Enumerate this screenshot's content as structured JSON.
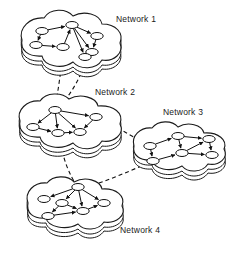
{
  "figure": {
    "background_color": "#ffffff",
    "line_color": "#111111",
    "node_fill": "#ffffff"
  },
  "labels": {
    "network1": "Network 1",
    "network2": "Network 2",
    "network3": "Network 3",
    "network4": "Network 4"
  },
  "chart_data": {
    "type": "diagram",
    "networks": [
      {
        "id": "network1",
        "label": "Network 1",
        "label_x": 116,
        "label_y": 22,
        "blob": {
          "cx": 68,
          "cy": 42,
          "path": "M 22 40 C 18 28 30 17 44 18 C 50 8 66 8 73 16 C 84 10 100 14 102 24 C 116 24 124 33 120 43 C 124 53 114 62 102 60 C 96 70 80 70 73 62 C 62 70 44 66 42 56 C 28 57 20 50 22 40 Z",
          "side_offsets": [
            5,
            9
          ]
        },
        "nodes": [
          {
            "id": "n1a",
            "x": 42,
            "y": 31
          },
          {
            "id": "n1b",
            "x": 72,
            "y": 25
          },
          {
            "id": "n1c",
            "x": 36,
            "y": 45
          },
          {
            "id": "n1d",
            "x": 63,
            "y": 47
          },
          {
            "id": "n1e",
            "x": 97,
            "y": 36
          },
          {
            "id": "n1f",
            "x": 92,
            "y": 52
          },
          {
            "id": "n1g",
            "x": 85,
            "y": 57
          }
        ],
        "edges": [
          {
            "from": "n1a",
            "to": "n1b",
            "directed": true
          },
          {
            "from": "n1a",
            "to": "n1c",
            "directed": true
          },
          {
            "from": "n1c",
            "to": "n1d",
            "directed": true
          },
          {
            "from": "n1d",
            "to": "n1b",
            "directed": true
          },
          {
            "from": "n1b",
            "to": "n1e",
            "directed": true
          },
          {
            "from": "n1b",
            "to": "n1f",
            "directed": true
          },
          {
            "from": "n1b",
            "to": "n1g",
            "directed": true
          },
          {
            "from": "n1e",
            "to": "n1f",
            "directed": true
          },
          {
            "from": "n1f",
            "to": "n1g",
            "directed": true
          }
        ]
      },
      {
        "id": "network2",
        "label": "Network 2",
        "label_x": 95,
        "label_y": 95,
        "blob": {
          "cx": 70,
          "cy": 123,
          "path": "M 20 121 C 16 110 27 100 40 101 C 46 92 62 92 69 99 C 80 93 96 97 98 106 C 114 105 124 113 120 124 C 125 134 114 143 102 141 C 96 151 80 151 73 143 C 60 151 42 147 40 137 C 26 138 18 131 20 121 Z",
          "side_offsets": [
            5,
            9
          ]
        },
        "nodes": [
          {
            "id": "n2a",
            "x": 55,
            "y": 110
          },
          {
            "id": "n2b",
            "x": 33,
            "y": 127
          },
          {
            "id": "n2c",
            "x": 58,
            "y": 133
          },
          {
            "id": "n2d",
            "x": 80,
            "y": 132
          },
          {
            "id": "n2e",
            "x": 96,
            "y": 117
          }
        ],
        "edges": [
          {
            "from": "n2a",
            "to": "n2b",
            "directed": true
          },
          {
            "from": "n2b",
            "to": "n2c",
            "directed": true
          },
          {
            "from": "n2c",
            "to": "n2d",
            "directed": true
          },
          {
            "from": "n2a",
            "to": "n2d",
            "directed": true
          },
          {
            "from": "n2a",
            "to": "n2e",
            "directed": true
          },
          {
            "from": "n2e",
            "to": "n2d",
            "directed": true
          },
          {
            "from": "n2a",
            "to": "n2c",
            "directed": true
          }
        ]
      },
      {
        "id": "network3",
        "label": "Network 3",
        "label_x": 163,
        "label_y": 115,
        "blob": {
          "cx": 180,
          "cy": 147,
          "path": "M 134 146 C 131 136 140 127 152 128 C 158 120 172 120 178 127 C 188 121 202 125 204 133 C 218 132 228 140 224 149 C 229 158 219 166 208 164 C 202 173 188 173 182 166 C 170 173 154 169 152 160 C 140 161 132 155 134 146 Z",
          "side_offsets": [
            5,
            9
          ]
        },
        "nodes": [
          {
            "id": "n3a",
            "x": 150,
            "y": 146
          },
          {
            "id": "n3b",
            "x": 178,
            "y": 136
          },
          {
            "id": "n3c",
            "x": 153,
            "y": 161
          },
          {
            "id": "n3d",
            "x": 182,
            "y": 153
          },
          {
            "id": "n3e",
            "x": 209,
            "y": 139
          },
          {
            "id": "n3f",
            "x": 212,
            "y": 155
          }
        ],
        "edges": [
          {
            "from": "n3a",
            "to": "n3b",
            "directed": true
          },
          {
            "from": "n3a",
            "to": "n3c",
            "directed": true
          },
          {
            "from": "n3c",
            "to": "n3d",
            "directed": true
          },
          {
            "from": "n3b",
            "to": "n3d",
            "directed": true
          },
          {
            "from": "n3b",
            "to": "n3e",
            "directed": true
          },
          {
            "from": "n3d",
            "to": "n3e",
            "directed": true
          },
          {
            "from": "n3e",
            "to": "n3f",
            "directed": true
          },
          {
            "from": "n3d",
            "to": "n3f",
            "directed": true
          }
        ]
      },
      {
        "id": "network4",
        "label": "Network 4",
        "label_x": 120,
        "label_y": 233,
        "blob": {
          "cx": 82,
          "cy": 203,
          "path": "M 28 203 C 24 192 34 182 47 183 C 53 175 68 175 74 182 C 85 176 100 180 102 189 C 116 188 126 196 122 206 C 127 215 116 224 104 222 C 98 231 84 231 78 224 C 66 231 48 227 46 218 C 33 219 26 213 28 203 Z",
          "side_offsets": [
            5,
            9
          ]
        },
        "nodes": [
          {
            "id": "n4a",
            "x": 78,
            "y": 187
          },
          {
            "id": "n4b",
            "x": 44,
            "y": 199
          },
          {
            "id": "n4c",
            "x": 62,
            "y": 203
          },
          {
            "id": "n4d",
            "x": 48,
            "y": 216
          },
          {
            "id": "n4e",
            "x": 83,
            "y": 211
          },
          {
            "id": "n4f",
            "x": 104,
            "y": 203
          }
        ],
        "edges": [
          {
            "from": "n4a",
            "to": "n4b",
            "directed": true
          },
          {
            "from": "n4a",
            "to": "n4c",
            "directed": true
          },
          {
            "from": "n4c",
            "to": "n4d",
            "directed": true
          },
          {
            "from": "n4a",
            "to": "n4e",
            "directed": true
          },
          {
            "from": "n4c",
            "to": "n4e",
            "directed": true
          },
          {
            "from": "n4e",
            "to": "n4f",
            "directed": true
          },
          {
            "from": "n4a",
            "to": "n4f",
            "directed": true
          },
          {
            "from": "n4d",
            "to": "n4e",
            "directed": true
          }
        ]
      }
    ],
    "interlinks": [
      {
        "id": "link-1-2-left",
        "from": "network1",
        "to": "network2",
        "style": "dashed",
        "path": "M 63 52 C 61 70 58 92 55 108"
      },
      {
        "id": "link-1-2-right",
        "from": "network1",
        "to": "network2",
        "style": "dashed",
        "path": "M 85 60 C 82 76 70 96 58 108"
      },
      {
        "id": "link-2-3",
        "from": "network2",
        "to": "network3",
        "style": "dashed",
        "path": "M 99 118 C 112 124 128 134 146 144"
      },
      {
        "id": "link-2-4",
        "from": "network2",
        "to": "network4",
        "style": "dashed",
        "path": "M 60 137 C 62 158 70 176 77 186"
      },
      {
        "id": "link-3-4",
        "from": "network3",
        "to": "network4",
        "style": "dashed",
        "path": "M 148 163 C 128 172 104 182 84 188"
      }
    ]
  }
}
